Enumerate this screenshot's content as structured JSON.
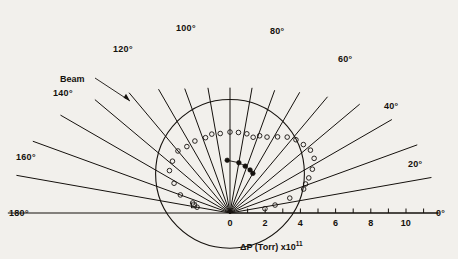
{
  "figure": {
    "kind": "polar-scatter",
    "background_color": "#f2f0ec",
    "ink_color": "#15110d",
    "beam_label": "Beam",
    "axis_caption_main": "ΔP (Torr)  x10",
    "axis_caption_exponent": "11"
  },
  "angle_labels": [
    {
      "text": "0°",
      "x": 436,
      "y": 208
    },
    {
      "text": "20°",
      "x": 408,
      "y": 159
    },
    {
      "text": "40°",
      "x": 384,
      "y": 101
    },
    {
      "text": "60°",
      "x": 338,
      "y": 54
    },
    {
      "text": "80°",
      "x": 270,
      "y": 26
    },
    {
      "text": "100°",
      "x": 176,
      "y": 23
    },
    {
      "text": "120°",
      "x": 113,
      "y": 44
    },
    {
      "text": "140°",
      "x": 53,
      "y": 88
    },
    {
      "text": "160°",
      "x": 16,
      "y": 152
    },
    {
      "text": "180°",
      "x": 9,
      "y": 208
    }
  ],
  "axis": {
    "tick_values": [
      0,
      1,
      2,
      3,
      4,
      5,
      6,
      7,
      8,
      9,
      10,
      11
    ],
    "labeled_ticks": [
      {
        "value": 0,
        "text": "0"
      },
      {
        "value": 2,
        "text": "2"
      },
      {
        "value": 4,
        "text": "4"
      },
      {
        "value": 6,
        "text": "6"
      },
      {
        "value": 8,
        "text": "8"
      },
      {
        "value": 10,
        "text": "10"
      }
    ],
    "range": [
      0,
      11.6
    ],
    "units": "Torr x10^11"
  },
  "chart_data": {
    "type": "scatter",
    "title": "",
    "xlabel": "ΔP (Torr)  x10^11",
    "ylabel": "",
    "grid": false,
    "legend": [],
    "polar": {
      "origin_px": [
        230,
        213
      ],
      "px_per_unit": 17.6,
      "angle_spokes_deg": [
        0,
        10,
        20,
        30,
        40,
        50,
        60,
        70,
        80,
        90,
        100,
        110,
        120,
        130,
        140,
        150,
        160,
        170,
        180
      ],
      "reference_circle_radius_units": 4.45,
      "beam_direction_deg": 140
    },
    "series": [
      {
        "name": "open-circles",
        "marker": "open-circle",
        "points": [
          {
            "angle": 170,
            "r": 1.9
          },
          {
            "angle": 165,
            "r": 2.2
          },
          {
            "angle": 160,
            "r": 3.0
          },
          {
            "angle": 152,
            "r": 3.6
          },
          {
            "angle": 145,
            "r": 4.2
          },
          {
            "angle": 138,
            "r": 4.4
          },
          {
            "angle": 130,
            "r": 4.6
          },
          {
            "angle": 123,
            "r": 4.5
          },
          {
            "angle": 116,
            "r": 4.55
          },
          {
            "angle": 108,
            "r": 4.5
          },
          {
            "angle": 103,
            "r": 4.6
          },
          {
            "angle": 97,
            "r": 4.55
          },
          {
            "angle": 90,
            "r": 4.6
          },
          {
            "angle": 84,
            "r": 4.6
          },
          {
            "angle": 78,
            "r": 4.6
          },
          {
            "angle": 73,
            "r": 4.5
          },
          {
            "angle": 69,
            "r": 4.7
          },
          {
            "angle": 64,
            "r": 4.8
          },
          {
            "angle": 58,
            "r": 5.1
          },
          {
            "angle": 53,
            "r": 5.4
          },
          {
            "angle": 48,
            "r": 5.6
          },
          {
            "angle": 43,
            "r": 5.7
          },
          {
            "angle": 38,
            "r": 5.8
          },
          {
            "angle": 33,
            "r": 5.7
          },
          {
            "angle": 28,
            "r": 5.3
          },
          {
            "angle": 24,
            "r": 4.9
          },
          {
            "angle": 21,
            "r": 4.6
          },
          {
            "angle": 18,
            "r": 4.4
          },
          {
            "angle": 14,
            "r": 3.5
          },
          {
            "angle": 10,
            "r": 2.6
          },
          {
            "angle": 7,
            "r": 2.0
          }
        ]
      },
      {
        "name": "filled-circles",
        "marker": "filled-circle",
        "points": [
          {
            "angle": 93,
            "r": 3.0
          },
          {
            "angle": 80,
            "r": 2.9
          },
          {
            "angle": 72,
            "r": 2.8
          },
          {
            "angle": 65,
            "r": 2.7
          },
          {
            "angle": 60,
            "r": 2.6
          }
        ]
      },
      {
        "name": "square-marker",
        "marker": "open-square",
        "points": [
          {
            "angle": 168,
            "r": 2.1
          }
        ]
      }
    ]
  }
}
